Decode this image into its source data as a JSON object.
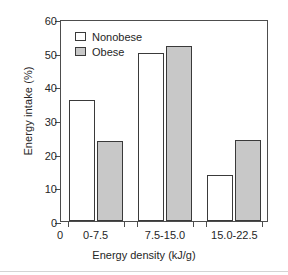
{
  "chart_data": {
    "type": "bar",
    "title": "",
    "subtitle": "",
    "xlabel": "Energy density (kJ/g)",
    "ylabel": "Energy intake (%)",
    "categories": [
      "0-7.5",
      "7.5-15.0",
      "15.0-22.5"
    ],
    "series": [
      {
        "name": "Nonobese",
        "color": "#ffffff",
        "values": [
          36.0,
          50.0,
          13.8
        ]
      },
      {
        "name": "Obese",
        "color": "#c8c8c8",
        "values": [
          23.8,
          52.0,
          24.2
        ]
      }
    ],
    "ylim": [
      0,
      60
    ],
    "yticks": [
      0,
      10,
      20,
      30,
      40,
      50,
      60
    ],
    "ytick_labels": [
      "0",
      "10",
      "20",
      "30",
      "40",
      "50",
      "60"
    ],
    "origin_label": "0",
    "grid": false,
    "legend_position": "top-left-inside",
    "legend": [
      "Nonobese",
      "Obese"
    ],
    "axis_color": "#4d4d4d",
    "bar_edge_color": "#3a3a3a",
    "background": "#ffffff"
  }
}
